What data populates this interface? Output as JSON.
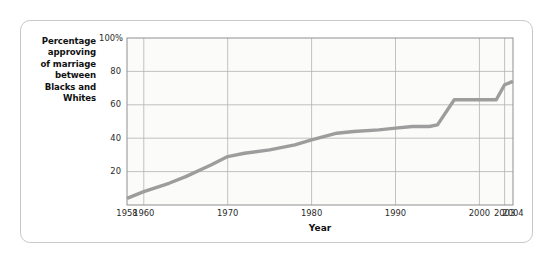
{
  "figure": {
    "y_axis_caption_lines": [
      "Percentage",
      "approving",
      "of marriage",
      "between",
      "Blacks and",
      "Whites"
    ],
    "line_color": "#9d9d9d",
    "grid_color": "#b3b3b3",
    "plot_bg": "#fbfbfa"
  },
  "chart_data": {
    "type": "line",
    "title": "",
    "subtitle": "",
    "xlabel": "Year",
    "ylabel": "Percentage approving of marriage between Blacks and Whites",
    "xlim": [
      1958,
      2004
    ],
    "ylim": [
      0,
      100
    ],
    "grid": true,
    "legend": "none",
    "x_tick_labels": [
      "1958",
      "1960",
      "1970",
      "1980",
      "1990",
      "2000",
      "2003",
      "2004"
    ],
    "x_tick_values": [
      1958,
      1960,
      1970,
      1980,
      1990,
      2000,
      2003,
      2004
    ],
    "y_tick_labels": [
      "100%",
      "80",
      "60",
      "40",
      "20"
    ],
    "y_tick_values": [
      100,
      80,
      60,
      40,
      20
    ],
    "series": [
      {
        "name": "Percentage approving of marriage between Blacks and Whites",
        "color": "#9d9d9d",
        "x": [
          1958,
          1960,
          1963,
          1965,
          1968,
          1970,
          1972,
          1975,
          1978,
          1980,
          1983,
          1985,
          1988,
          1990,
          1992,
          1994,
          1995,
          1997,
          1999,
          2001,
          2002,
          2003,
          2004
        ],
        "values": [
          4,
          8,
          13,
          17,
          24,
          29,
          31,
          33,
          36,
          39,
          43,
          44,
          45,
          46,
          47,
          47,
          48,
          63,
          63,
          63,
          63,
          72,
          74
        ]
      }
    ]
  }
}
